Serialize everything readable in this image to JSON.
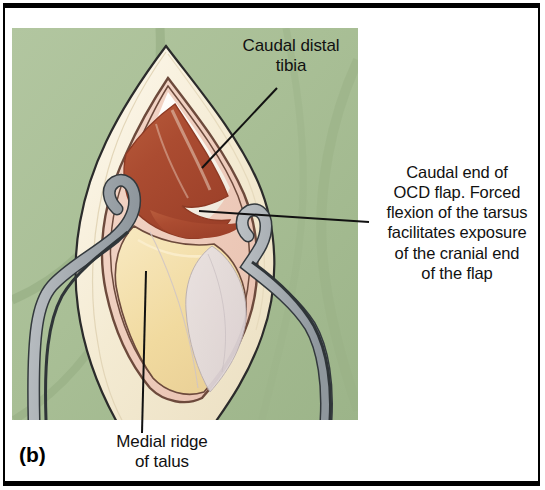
{
  "figure": {
    "panel_letter": "(b)",
    "labels": [
      {
        "name": "caudal-distal-tibia",
        "text": "Caudal distal\ntibia",
        "lines": [
          "Caudal distal",
          "tibia"
        ]
      },
      {
        "name": "caudal-end-ocd-flap",
        "text": "Caudal end of\nOCD flap. Forced\nflexion of the tarsus\nfacilitates exposure\nof the cranial end\nof the flap",
        "lines": [
          "Caudal end of",
          "OCD flap. Forced",
          "flexion of the tarsus",
          "facilitates exposure",
          "of the cranial end",
          "of the flap"
        ]
      },
      {
        "name": "medial-ridge-of-talus",
        "text": "Medial ridge\nof talus",
        "lines": [
          "Medial ridge",
          "of talus"
        ]
      }
    ],
    "colors": {
      "page_background": "#ffffff",
      "frame_rule": "#000000",
      "drape_green": "#a9bf96",
      "drape_green_shadow": "#93ab80",
      "skin_flap_cream": "#f3ead2",
      "skin_flap_highlight": "#faf4e4",
      "subcutaneous_pink": "#f0cfc0",
      "bone_tan": "#f2dda8",
      "cartilage_white": "#fdfaf2",
      "ocd_lesion_dark_red": "#ab4c31",
      "ocd_lesion_mid_red": "#bd5f3e",
      "joint_outline_brown": "#6d4a3c",
      "retractor_steel": "#a8aeb2",
      "retractor_steel_dark": "#8c949a",
      "leader_line": "#111111",
      "label_text": "#111111"
    },
    "artwork": {
      "type": "surgical-anatomical-illustration",
      "subject": "caudomedial arthrotomy of the tarsus exposing an OCD flap on the medial ridge of the talus",
      "elements": [
        "green surgical drape background",
        "lens-shaped skin incision with reflected cream-coloured skin edges",
        "open joint capsule with brown outline",
        "dark red osteochondral (OCD) lesion bed on the caudal distal tibia",
        "tan talar ridge with articular cartilage",
        "two curved steel hook retractors holding the incision open",
        "three black leader lines pointing from labels to structures"
      ]
    }
  }
}
